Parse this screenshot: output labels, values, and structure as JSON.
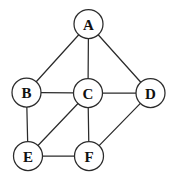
{
  "figure": {
    "background_color": "#ffffff",
    "width": 174,
    "height": 182
  },
  "chart_data": {
    "type": "diagram",
    "subtype": "node-link-graph",
    "title": "",
    "directed": false,
    "weighted": false,
    "node_radius": 14.5,
    "node_fill": "#ffffff",
    "node_stroke": "#2b2b2b",
    "edge_stroke": "#2b2b2b",
    "edge_width": 1.25,
    "node_count": 6,
    "edge_count": 10,
    "nodes": [
      {
        "id": "A",
        "label": "A",
        "x": 88.5,
        "y": 24.0,
        "degree": 3
      },
      {
        "id": "B",
        "label": "B",
        "x": 26.5,
        "y": 92.5,
        "degree": 3
      },
      {
        "id": "C",
        "label": "C",
        "x": 88.0,
        "y": 93.0,
        "degree": 5
      },
      {
        "id": "D",
        "label": "D",
        "x": 150.5,
        "y": 93.0,
        "degree": 3
      },
      {
        "id": "E",
        "label": "E",
        "x": 28.0,
        "y": 156.0,
        "degree": 3
      },
      {
        "id": "F",
        "label": "F",
        "x": 89.0,
        "y": 156.0,
        "degree": 3
      }
    ],
    "edges": [
      {
        "source": "A",
        "target": "B"
      },
      {
        "source": "A",
        "target": "C"
      },
      {
        "source": "A",
        "target": "D"
      },
      {
        "source": "B",
        "target": "C"
      },
      {
        "source": "C",
        "target": "D"
      },
      {
        "source": "B",
        "target": "E"
      },
      {
        "source": "C",
        "target": "E"
      },
      {
        "source": "C",
        "target": "F"
      },
      {
        "source": "D",
        "target": "F"
      },
      {
        "source": "E",
        "target": "F"
      }
    ]
  }
}
